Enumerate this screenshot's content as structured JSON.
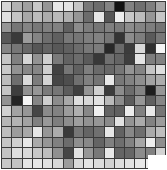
{
  "figure": {
    "kind": "grayscale-heatmap",
    "width_px": 167,
    "height_px": 170,
    "background_color": "#ffffff",
    "grid_line_color": "#3a3a3a",
    "border_color": "#3a3a3a",
    "corner_notch": {
      "color": "#ffffff",
      "left_px": 148,
      "top_px": 155,
      "width_px": 19,
      "height_px": 15
    }
  },
  "chart_data": {
    "type": "heatmap",
    "title": "",
    "subtitle": "",
    "xlabel": "",
    "ylabel": "",
    "xticklabels": [],
    "yticklabels": [],
    "legend": [],
    "grid": true,
    "legend_position": "none",
    "colormap": "gray",
    "vmin": 0,
    "vmax": 255,
    "rows": 16,
    "cols": 16,
    "annotations": [],
    "values": [
      [
        215,
        178,
        160,
        200,
        150,
        232,
        228,
        198,
        120,
        108,
        132,
        18,
        130,
        112,
        128,
        168
      ],
      [
        225,
        196,
        168,
        188,
        172,
        186,
        176,
        150,
        108,
        230,
        86,
        238,
        200,
        188,
        150,
        198
      ],
      [
        150,
        118,
        132,
        120,
        128,
        130,
        96,
        140,
        124,
        118,
        128,
        122,
        140,
        132,
        126,
        116
      ],
      [
        88,
        58,
        156,
        132,
        110,
        96,
        120,
        118,
        126,
        130,
        118,
        52,
        140,
        126,
        90,
        120
      ],
      [
        132,
        118,
        104,
        86,
        100,
        88,
        96,
        108,
        120,
        124,
        40,
        106,
        60,
        216,
        48,
        245
      ],
      [
        196,
        128,
        214,
        146,
        208,
        122,
        98,
        108,
        90,
        56,
        112,
        100,
        62,
        228,
        126,
        130
      ],
      [
        200,
        146,
        136,
        134,
        206,
        66,
        118,
        96,
        126,
        106,
        104,
        118,
        148,
        132,
        196,
        222
      ],
      [
        188,
        110,
        218,
        124,
        212,
        70,
        78,
        112,
        128,
        116,
        232,
        120,
        130,
        142,
        162,
        172
      ],
      [
        196,
        62,
        146,
        150,
        122,
        118,
        92,
        64,
        148,
        208,
        60,
        140,
        108,
        132,
        30,
        150
      ],
      [
        146,
        36,
        246,
        134,
        206,
        140,
        168,
        222,
        216,
        226,
        186,
        140,
        92,
        150,
        96,
        134
      ],
      [
        208,
        162,
        150,
        70,
        138,
        130,
        156,
        176,
        136,
        240,
        100,
        96,
        236,
        128,
        232,
        118
      ],
      [
        182,
        178,
        162,
        128,
        152,
        126,
        142,
        158,
        146,
        150,
        138,
        226,
        148,
        170,
        130,
        156
      ],
      [
        190,
        156,
        168,
        230,
        150,
        172,
        58,
        118,
        100,
        112,
        230,
        98,
        136,
        110,
        170,
        190
      ],
      [
        198,
        208,
        232,
        170,
        150,
        128,
        108,
        142,
        136,
        100,
        128,
        110,
        130,
        166,
        238,
        142
      ],
      [
        196,
        222,
        218,
        200,
        190,
        144,
        70,
        226,
        150,
        120,
        232,
        100,
        102,
        140,
        128,
        210
      ],
      [
        200,
        196,
        230,
        232,
        226,
        216,
        156,
        218,
        228,
        220,
        210,
        222,
        226,
        232,
        240,
        236
      ]
    ]
  }
}
